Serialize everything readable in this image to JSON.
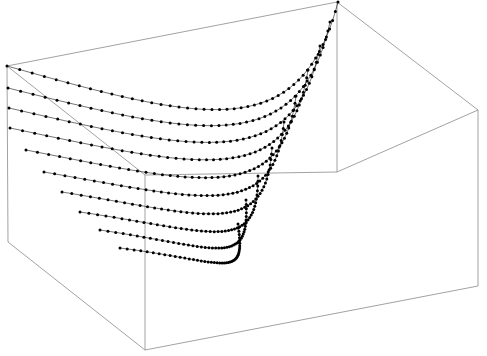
{
  "figure": {
    "title": "",
    "background_color": "#ffffff",
    "width": 487,
    "height": 356
  },
  "box": {
    "name": "3d-bounding-box",
    "edge_color": "#8a8a8a",
    "edge_width": 0.8,
    "vertices": {
      "back_top_left": [
        7,
        66
      ],
      "back_top_right": [
        337,
        2
      ],
      "far_top_right": [
        478,
        110
      ],
      "front_top_center": [
        145,
        175
      ],
      "back_bottom_left": [
        8,
        242
      ],
      "inner_vertex": [
        337,
        172
      ],
      "far_bottom_right": [
        478,
        286
      ],
      "front_bottom_center": [
        145,
        350
      ]
    },
    "edges": [
      [
        "back_top_left",
        "back_top_right"
      ],
      [
        "back_top_right",
        "far_top_right"
      ],
      [
        "back_top_left",
        "front_top_center"
      ],
      [
        "front_top_center",
        "inner_vertex"
      ],
      [
        "inner_vertex",
        "far_top_right"
      ],
      [
        "back_top_left",
        "back_bottom_left"
      ],
      [
        "back_bottom_left",
        "front_bottom_center"
      ],
      [
        "front_bottom_center",
        "far_bottom_right"
      ],
      [
        "far_bottom_right",
        "far_top_right"
      ],
      [
        "front_top_center",
        "front_bottom_center"
      ],
      [
        "back_top_right",
        "inner_vertex"
      ]
    ]
  },
  "chart_data": {
    "type": "scatter",
    "title": "",
    "subtitle": "",
    "xlabel": "",
    "ylabel": "",
    "zlabel": "",
    "grid": false,
    "legend": null,
    "marker": "filled-circle",
    "marker_color": "#000000",
    "marker_radius_px": 1.5,
    "n_series": 10,
    "points_per_series": 46,
    "axis_ranges": {
      "x": [
        0,
        1
      ],
      "y": [
        0,
        1
      ],
      "z": [
        0,
        1
      ]
    },
    "series": [
      {
        "name": "curve-1",
        "y_level": 0.0,
        "start_px": [
          7,
          66
        ],
        "mid_px": [
          200,
          120
        ],
        "bend_px": [
          300,
          148
        ],
        "end_px": [
          338,
          2
        ]
      },
      {
        "name": "curve-2",
        "y_level": 0.11,
        "start_px": [
          8,
          88
        ],
        "mid_px": [
          200,
          136
        ],
        "bend_px": [
          300,
          160
        ],
        "end_px": [
          330,
          22
        ]
      },
      {
        "name": "curve-3",
        "y_level": 0.22,
        "start_px": [
          9,
          108
        ],
        "mid_px": [
          200,
          152
        ],
        "bend_px": [
          296,
          174
        ],
        "end_px": [
          320,
          46
        ]
      },
      {
        "name": "curve-4",
        "y_level": 0.33,
        "start_px": [
          10,
          128
        ],
        "mid_px": [
          200,
          168
        ],
        "bend_px": [
          290,
          190
        ],
        "end_px": [
          308,
          70
        ]
      },
      {
        "name": "curve-5",
        "y_level": 0.44,
        "start_px": [
          26,
          150
        ],
        "mid_px": [
          200,
          184
        ],
        "bend_px": [
          282,
          206
        ],
        "end_px": [
          296,
          96
        ]
      },
      {
        "name": "curve-6",
        "y_level": 0.56,
        "start_px": [
          44,
          172
        ],
        "mid_px": [
          205,
          200
        ],
        "bend_px": [
          274,
          222
        ],
        "end_px": [
          284,
          122
        ]
      },
      {
        "name": "curve-7",
        "y_level": 0.67,
        "start_px": [
          62,
          192
        ],
        "mid_px": [
          210,
          216
        ],
        "bend_px": [
          266,
          240
        ],
        "end_px": [
          272,
          148
        ]
      },
      {
        "name": "curve-8",
        "y_level": 0.78,
        "start_px": [
          80,
          212
        ],
        "mid_px": [
          216,
          232
        ],
        "bend_px": [
          258,
          256
        ],
        "end_px": [
          258,
          176
        ]
      },
      {
        "name": "curve-9",
        "y_level": 0.89,
        "start_px": [
          100,
          230
        ],
        "mid_px": [
          222,
          248
        ],
        "bend_px": [
          250,
          270
        ],
        "end_px": [
          246,
          200
        ]
      },
      {
        "name": "curve-10",
        "y_level": 1.0,
        "start_px": [
          120,
          248
        ],
        "mid_px": [
          230,
          262
        ],
        "bend_px": [
          246,
          282
        ],
        "end_px": [
          238,
          224
        ]
      }
    ]
  }
}
